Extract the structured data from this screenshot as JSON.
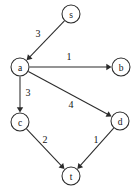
{
  "diagram": {
    "type": "directed-weighted-graph",
    "title": "",
    "background_color": "#ffffff",
    "stroke_color": "#2b2b2b",
    "text_color": "#141414",
    "node_radius": 9,
    "nodes": [
      {
        "id": "s",
        "label": "s",
        "x": 71,
        "y": 14
      },
      {
        "id": "a",
        "label": "a",
        "x": 20,
        "y": 67
      },
      {
        "id": "b",
        "label": "b",
        "x": 121,
        "y": 67
      },
      {
        "id": "c",
        "label": "c",
        "x": 20,
        "y": 122
      },
      {
        "id": "d",
        "label": "d",
        "x": 120,
        "y": 121
      },
      {
        "id": "t",
        "label": "t",
        "x": 71,
        "y": 176
      }
    ],
    "edges": [
      {
        "id": "s-a",
        "from": "s",
        "to": "a",
        "weight": "3",
        "label_x": 38,
        "label_y": 33
      },
      {
        "id": "a-b",
        "from": "a",
        "to": "b",
        "weight": "1",
        "label_x": 69,
        "label_y": 56
      },
      {
        "id": "a-c",
        "from": "a",
        "to": "c",
        "weight": "3",
        "label_x": 28,
        "label_y": 92
      },
      {
        "id": "a-d",
        "from": "a",
        "to": "d",
        "weight": "4",
        "label_x": 71,
        "label_y": 104
      },
      {
        "id": "c-t",
        "from": "c",
        "to": "t",
        "weight": "2",
        "label_x": 45,
        "label_y": 139
      },
      {
        "id": "d-t",
        "from": "d",
        "to": "t",
        "weight": "1",
        "label_x": 96,
        "label_y": 139
      }
    ]
  }
}
